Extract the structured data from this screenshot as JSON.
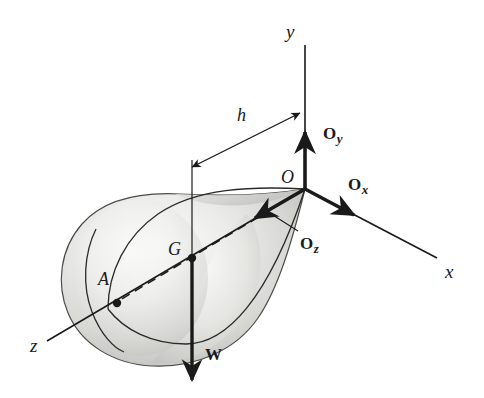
{
  "figure": {
    "background_color": "#ffffff",
    "line_color": "#1a1a1a",
    "body_fill_light": "#f2f2f0",
    "body_fill_mid": "#d9d9d7",
    "body_fill_dark": "#b9b9b6"
  },
  "axes": [
    {
      "name": "y-axis",
      "label": "y",
      "label_x": 286,
      "label_y": 22,
      "direction": "up"
    },
    {
      "name": "x-axis",
      "label": "x",
      "label_x": 445,
      "label_y": 262,
      "direction": "down-right"
    },
    {
      "name": "z-axis",
      "label": "z",
      "label_x": 30,
      "label_y": 336,
      "direction": "down-left"
    }
  ],
  "points": [
    {
      "name": "origin",
      "label": "O",
      "label_x": 281,
      "label_y": 168
    },
    {
      "name": "center-of-gravity",
      "label": "G",
      "label_x": 168,
      "label_y": 240
    },
    {
      "name": "surface-point-a",
      "label": "A",
      "label_x": 98,
      "label_y": 270
    }
  ],
  "forces": [
    {
      "name": "reaction-oy",
      "label": "O",
      "subscript": "y",
      "label_x": 323,
      "label_y": 125,
      "direction": "up"
    },
    {
      "name": "reaction-ox",
      "label": "O",
      "subscript": "x",
      "label_x": 348,
      "label_y": 176,
      "direction": "down-right"
    },
    {
      "name": "reaction-oz",
      "label": "O",
      "subscript": "z",
      "label_x": 300,
      "label_y": 235,
      "direction": "down-left"
    },
    {
      "name": "weight",
      "label": "W",
      "subscript": "",
      "label_x": 205,
      "label_y": 346,
      "direction": "down"
    }
  ],
  "dimensions": [
    {
      "name": "height-h",
      "label": "h",
      "label_x": 237,
      "label_y": 106,
      "type": "double-arrow"
    }
  ]
}
